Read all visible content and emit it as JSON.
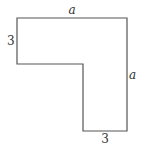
{
  "diagram": {
    "type": "L-shaped polygon",
    "stroke_color": "#555555",
    "fill_color": "#ffffff",
    "vertices": [
      [
        17,
        18
      ],
      [
        127,
        18
      ],
      [
        127,
        131
      ],
      [
        83,
        131
      ],
      [
        83,
        64
      ],
      [
        17,
        64
      ]
    ],
    "labels": {
      "top": "a",
      "right": "a",
      "left": "3",
      "bottom": "3"
    }
  }
}
